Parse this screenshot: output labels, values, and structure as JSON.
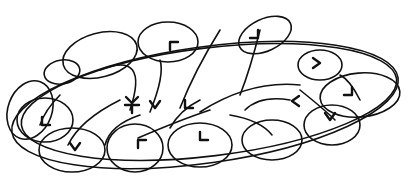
{
  "diagram": {
    "type": "hand-drawn loop sketch",
    "background": "#ffffff",
    "ink": "#111111",
    "outer_ellipse": {
      "cx": 205,
      "cy": 105,
      "rx": 195,
      "ry": 58,
      "rot": -8
    },
    "loops": [
      {
        "id": "top-left-small",
        "cx": 62,
        "cy": 72,
        "rx": 18,
        "ry": 12,
        "rot": -10
      },
      {
        "id": "top-left",
        "cx": 100,
        "cy": 55,
        "rx": 38,
        "ry": 22,
        "rot": -15
      },
      {
        "id": "top-center",
        "cx": 168,
        "cy": 42,
        "rx": 30,
        "ry": 20,
        "rot": 0
      },
      {
        "id": "top-right",
        "cx": 265,
        "cy": 35,
        "rx": 28,
        "ry": 16,
        "rot": -25
      },
      {
        "id": "right-upper",
        "cx": 320,
        "cy": 65,
        "rx": 22,
        "ry": 15,
        "rot": 0
      },
      {
        "id": "right",
        "cx": 360,
        "cy": 95,
        "rx": 40,
        "ry": 22,
        "rot": -5
      },
      {
        "id": "bottom-right",
        "cx": 332,
        "cy": 125,
        "rx": 28,
        "ry": 20,
        "rot": 0
      },
      {
        "id": "bottom-right-mid",
        "cx": 272,
        "cy": 140,
        "rx": 30,
        "ry": 20,
        "rot": 0
      },
      {
        "id": "bottom-center",
        "cx": 200,
        "cy": 145,
        "rx": 32,
        "ry": 22,
        "rot": 0
      },
      {
        "id": "bottom-center-left",
        "cx": 135,
        "cy": 148,
        "rx": 28,
        "ry": 24,
        "rot": 0
      },
      {
        "id": "bottom-left",
        "cx": 72,
        "cy": 150,
        "rx": 33,
        "ry": 22,
        "rot": 0
      },
      {
        "id": "left",
        "cx": 45,
        "cy": 120,
        "rx": 28,
        "ry": 22,
        "rot": 0
      },
      {
        "id": "left-outer",
        "cx": 30,
        "cy": 110,
        "rx": 22,
        "ry": 30,
        "rot": 20
      }
    ],
    "arrows": [
      {
        "id": "arrow-1",
        "path": "M100 70 Q150 50 130 110",
        "head": [
          130,
          110
        ]
      },
      {
        "id": "arrow-2",
        "path": "M160 60 Q165 75 150 112",
        "head": [
          150,
          112
        ]
      },
      {
        "id": "arrow-3",
        "path": "M220 30 Q195 70 180 108",
        "head": [
          180,
          108
        ]
      },
      {
        "id": "arrow-4",
        "path": "M300 85 Q250 80 200 112",
        "head": [
          200,
          112
        ]
      },
      {
        "id": "arrow-5",
        "path": "M260 30 Q250 70 240 95",
        "head": [
          240,
          95
        ]
      },
      {
        "id": "arrow-6",
        "path": "M290 100 Q260 95 245 110",
        "head": [
          245,
          110
        ]
      },
      {
        "id": "arrow-7",
        "path": "M210 110 Q180 120 138 138",
        "head": [
          138,
          138
        ]
      },
      {
        "id": "arrow-8",
        "path": "M230 115 Q260 120 272 135",
        "head": [
          272,
          135
        ]
      },
      {
        "id": "arrow-9",
        "path": "M300 90 Q325 110 335 120",
        "head": [
          335,
          120
        ]
      },
      {
        "id": "arrow-10",
        "path": "M340 75 Q350 80 360 100",
        "head": [
          360,
          100
        ]
      },
      {
        "id": "arrow-11",
        "path": "M120 100 Q80 120 68 145",
        "head": [
          68,
          145
        ]
      },
      {
        "id": "arrow-12",
        "path": "M60 95 Q45 110 40 125",
        "head": [
          40,
          125
        ]
      },
      {
        "id": "arrow-13",
        "path": "M200 100 Q180 110 170 128",
        "head": [
          170,
          128
        ]
      },
      {
        "id": "arrow-14",
        "path": "M140 115 Q110 125 105 145",
        "head": [
          105,
          145
        ]
      }
    ],
    "chevrons": [
      {
        "id": "chev-top-center",
        "x": 170,
        "y": 42,
        "dir": "up-left"
      },
      {
        "id": "chev-top-right",
        "x": 258,
        "y": 38,
        "dir": "down-right"
      },
      {
        "id": "chev-right-upper",
        "x": 320,
        "y": 63,
        "dir": "right"
      },
      {
        "id": "chev-right",
        "x": 352,
        "y": 95,
        "dir": "down-right"
      },
      {
        "id": "chev-mid-right",
        "x": 292,
        "y": 101,
        "dir": "left"
      },
      {
        "id": "chev-bottom-right",
        "x": 330,
        "y": 120,
        "dir": "down"
      },
      {
        "id": "chev-center",
        "x": 185,
        "y": 108,
        "dir": "down-left"
      },
      {
        "id": "chev-center2",
        "x": 155,
        "y": 108,
        "dir": "down"
      },
      {
        "id": "chev-left-center",
        "x": 132,
        "y": 103,
        "dir": "cross"
      },
      {
        "id": "chev-bottom-center",
        "x": 200,
        "y": 140,
        "dir": "down-left"
      },
      {
        "id": "chev-bottom-left-center",
        "x": 138,
        "y": 140,
        "dir": "up-left"
      },
      {
        "id": "chev-left",
        "x": 42,
        "y": 125,
        "dir": "down-left"
      },
      {
        "id": "chev-bottom-left",
        "x": 75,
        "y": 150,
        "dir": "down"
      }
    ]
  }
}
